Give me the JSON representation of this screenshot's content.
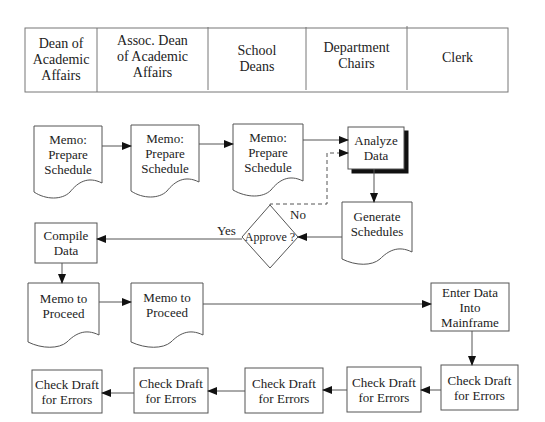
{
  "header": {
    "columns": [
      {
        "label": "Dean of\nAcademic\nAffairs"
      },
      {
        "label": "Assoc. Dean\nof Academic\nAffairs"
      },
      {
        "label": "School\nDeans"
      },
      {
        "label": "Department\nChairs"
      },
      {
        "label": "Clerk"
      }
    ]
  },
  "nodes": {
    "memo_prepare_1": {
      "label": "Memo:\nPrepare\nSchedule",
      "shape": "document"
    },
    "memo_prepare_2": {
      "label": "Memo:\nPrepare\nSchedule",
      "shape": "document"
    },
    "memo_prepare_3": {
      "label": "Memo:\nPrepare\nSchedule",
      "shape": "document"
    },
    "analyze_data": {
      "label": "Analyze\nData",
      "shape": "process-shadowed"
    },
    "generate_schedules": {
      "label": "Generate\nSchedules",
      "shape": "document"
    },
    "approve": {
      "label": "Approve ?",
      "shape": "decision"
    },
    "compile_data": {
      "label": "Compile\nData",
      "shape": "process"
    },
    "memo_proceed_1": {
      "label": "Memo to\nProceed",
      "shape": "document"
    },
    "memo_proceed_2": {
      "label": "Memo to\nProceed",
      "shape": "document"
    },
    "enter_data": {
      "label": "Enter Data\nInto\nMainframe",
      "shape": "process"
    },
    "check_draft_5": {
      "label": "Check Draft\nfor Errors",
      "shape": "process"
    },
    "check_draft_4": {
      "label": "Check Draft\nfor Errors",
      "shape": "process"
    },
    "check_draft_3": {
      "label": "Check Draft\nfor Errors",
      "shape": "process"
    },
    "check_draft_2": {
      "label": "Check Draft\nfor Errors",
      "shape": "process"
    },
    "check_draft_1": {
      "label": "Check Draft\nfor Errors",
      "shape": "process"
    }
  },
  "edges": {
    "yes_label": "Yes",
    "no_label": "No"
  },
  "colors": {
    "stroke": "#555555",
    "shadow": "#111111",
    "background": "#ffffff"
  }
}
